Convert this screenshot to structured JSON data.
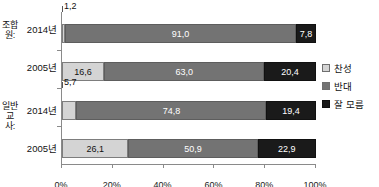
{
  "chart_data": {
    "type": "bar",
    "subtype": "stacked-horizontal-100pct",
    "title": "",
    "xlabel": "",
    "ylabel": "",
    "xlim": [
      0,
      100
    ],
    "grid": false,
    "legend_position": "right",
    "xticks": [
      "0%",
      "20%",
      "40%",
      "60%",
      "80%",
      "100%"
    ],
    "xtick_values": [
      0,
      20,
      40,
      60,
      80,
      100
    ],
    "groups": [
      {
        "label": "조합원:",
        "rows": [
          {
            "category": "2014년",
            "values": [
              1.2,
              91.0,
              7.8
            ],
            "display": [
              "1,2",
              "91,0",
              "7,8"
            ],
            "callout": true
          },
          {
            "category": "2005년",
            "values": [
              16.6,
              63.0,
              20.4
            ],
            "display": [
              "16,6",
              "63,0",
              "20,4"
            ],
            "callout": false
          }
        ]
      },
      {
        "label": "일반 교사:",
        "rows": [
          {
            "category": "2014년",
            "values": [
              5.7,
              74.8,
              19.4
            ],
            "display": [
              "5,7",
              "74,8",
              "19,4"
            ],
            "callout": true
          },
          {
            "category": "2005년",
            "values": [
              26.1,
              50.9,
              22.9
            ],
            "display": [
              "26,1",
              "50,9",
              "22,9"
            ],
            "callout": false
          }
        ]
      }
    ],
    "series": [
      {
        "name": "찬성",
        "color": "#d4d4d4",
        "values": [
          1.2,
          16.6,
          5.7,
          26.1
        ]
      },
      {
        "name": "반대",
        "color": "#737373",
        "values": [
          91.0,
          63.0,
          74.8,
          50.9
        ]
      },
      {
        "name": "잘 모름",
        "color": "#1a1a1a",
        "values": [
          7.8,
          20.4,
          19.4,
          22.9
        ]
      }
    ],
    "categories": [
      "조합원: 2014년",
      "조합원: 2005년",
      "일반 교사: 2014년",
      "일반 교사: 2005년"
    ]
  },
  "legend": {
    "items": [
      {
        "label": "찬성",
        "color": "#d4d4d4"
      },
      {
        "label": "반대",
        "color": "#737373"
      },
      {
        "label": "잘 모름",
        "color": "#1a1a1a"
      }
    ]
  }
}
